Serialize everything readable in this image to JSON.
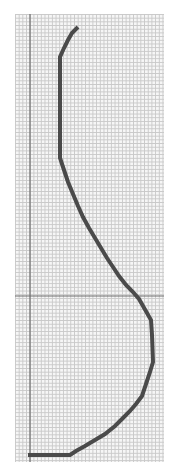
{
  "figure": {
    "grid": {
      "minor_spacing_px": 3.7,
      "line_color": "#c9c9c9",
      "background": "#f6f6f6"
    },
    "axes": {
      "vertical_axis_x": 30,
      "horizontal_axis_y": 296,
      "color": "#6e6e6e"
    },
    "curve": {
      "color": "#4a4a4a",
      "stroke_width": 4,
      "points": [
        [
          78,
          27
        ],
        [
          72,
          33
        ],
        [
          68,
          40
        ],
        [
          64,
          48
        ],
        [
          60,
          57
        ],
        [
          60,
          158
        ],
        [
          64,
          170
        ],
        [
          68,
          182
        ],
        [
          73,
          194
        ],
        [
          78,
          206
        ],
        [
          83,
          217
        ],
        [
          89,
          228
        ],
        [
          95,
          238
        ],
        [
          101,
          248
        ],
        [
          107,
          258
        ],
        [
          113,
          267
        ],
        [
          119,
          276
        ],
        [
          126,
          285
        ],
        [
          133,
          292
        ],
        [
          139,
          299
        ],
        [
          143,
          306
        ],
        [
          147,
          313
        ],
        [
          151,
          320
        ],
        [
          152,
          335
        ],
        [
          153,
          362
        ],
        [
          150,
          372
        ],
        [
          146,
          384
        ],
        [
          142,
          396
        ],
        [
          136,
          404
        ],
        [
          130,
          411
        ],
        [
          123,
          418
        ],
        [
          115,
          426
        ],
        [
          105,
          434
        ],
        [
          95,
          440
        ],
        [
          85,
          446
        ],
        [
          76,
          451
        ],
        [
          70,
          455
        ],
        [
          28,
          455
        ]
      ]
    }
  }
}
